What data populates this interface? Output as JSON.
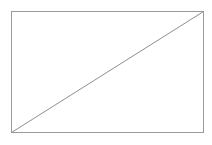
{
  "document": {
    "title": "Rectangle with diagonal",
    "background_color": "#ffffff",
    "width": 212,
    "height": 145
  },
  "figure": {
    "name": "rectangle-with-diagonal",
    "stroke_color": "#9a9a9a",
    "diagonal_color": "#8f8f8f",
    "fill_color": "#ffffff",
    "stroke_width": 1,
    "rectangle": {
      "x": 11,
      "y": 11,
      "width": 193,
      "height": 122,
      "left": 11,
      "top": 11,
      "right": 204,
      "bottom": 133
    },
    "diagonal": {
      "x1": 11,
      "y1": 133,
      "x2": 204,
      "y2": 11
    },
    "corners": {
      "top_left": "11,11",
      "top_right": "204,11",
      "bottom_right": "204,133",
      "bottom_left": "11,133"
    }
  }
}
